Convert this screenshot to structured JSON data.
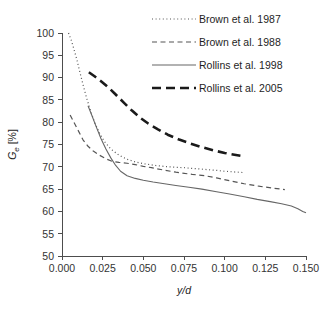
{
  "chart_data": {
    "type": "line",
    "title": "",
    "xlabel": "y/d",
    "ylabel": "Ge [%]",
    "ylabel_main": "G",
    "ylabel_sub": "e",
    "ylabel_unit": " [%]",
    "xlim": [
      0.0,
      0.15
    ],
    "ylim": [
      50,
      100
    ],
    "grid": false,
    "legend_position": "top-right",
    "xticks": [
      "0.000",
      "0.025",
      "0.050",
      "0.075",
      "0.100",
      "0.125",
      "0.150"
    ],
    "xtick_values": [
      0.0,
      0.025,
      0.05,
      0.075,
      0.1,
      0.125,
      0.15
    ],
    "yticks": [
      "50",
      "55",
      "60",
      "65",
      "70",
      "75",
      "80",
      "85",
      "90",
      "95",
      "100"
    ],
    "ytick_values": [
      50,
      55,
      60,
      65,
      70,
      75,
      80,
      85,
      90,
      95,
      100
    ],
    "series": [
      {
        "name": "Brown et al. 1987",
        "style": "dotted",
        "color": "#555555",
        "width": 1.2,
        "dash": "1,2.6",
        "points": [
          [
            0.004,
            100.0
          ],
          [
            0.0055,
            98.6
          ],
          [
            0.007,
            96.8
          ],
          [
            0.009,
            94.2
          ],
          [
            0.011,
            91.2
          ],
          [
            0.013,
            88.3
          ],
          [
            0.015,
            85.6
          ],
          [
            0.0175,
            82.6
          ],
          [
            0.02,
            80.0
          ],
          [
            0.023,
            77.6
          ],
          [
            0.026,
            75.7
          ],
          [
            0.03,
            74.0
          ],
          [
            0.035,
            72.6
          ],
          [
            0.04,
            71.7
          ],
          [
            0.045,
            71.1
          ],
          [
            0.05,
            70.7
          ],
          [
            0.0575,
            70.3
          ],
          [
            0.065,
            70.0
          ],
          [
            0.075,
            69.8
          ],
          [
            0.085,
            69.5
          ],
          [
            0.095,
            69.2
          ],
          [
            0.1,
            69.0
          ],
          [
            0.1075,
            68.8
          ],
          [
            0.112,
            68.7
          ]
        ]
      },
      {
        "name": "Brown et al. 1988",
        "style": "dashed",
        "color": "#555555",
        "width": 1.2,
        "dash": "5,3.5",
        "points": [
          [
            0.005,
            81.6
          ],
          [
            0.007,
            80.2
          ],
          [
            0.009,
            78.8
          ],
          [
            0.011,
            77.4
          ],
          [
            0.013,
            76.0
          ],
          [
            0.016,
            74.6
          ],
          [
            0.019,
            73.6
          ],
          [
            0.023,
            72.6
          ],
          [
            0.027,
            71.8
          ],
          [
            0.031,
            71.2
          ],
          [
            0.035,
            71.0
          ],
          [
            0.04,
            70.8
          ],
          [
            0.045,
            70.5
          ],
          [
            0.05,
            70.1
          ],
          [
            0.055,
            69.8
          ],
          [
            0.062,
            69.3
          ],
          [
            0.07,
            68.8
          ],
          [
            0.08,
            68.3
          ],
          [
            0.088,
            68.0
          ],
          [
            0.095,
            67.5
          ],
          [
            0.103,
            66.9
          ],
          [
            0.112,
            66.2
          ],
          [
            0.122,
            65.6
          ],
          [
            0.13,
            65.2
          ],
          [
            0.137,
            64.9
          ]
        ]
      },
      {
        "name": "Rollins et al. 1998",
        "style": "solid",
        "color": "#666666",
        "width": 1.1,
        "dash": "",
        "points": [
          [
            0.016,
            83.7
          ],
          [
            0.0185,
            81.4
          ],
          [
            0.021,
            79.0
          ],
          [
            0.024,
            76.3
          ],
          [
            0.027,
            74.0
          ],
          [
            0.03,
            72.0
          ],
          [
            0.033,
            70.3
          ],
          [
            0.036,
            69.0
          ],
          [
            0.04,
            68.0
          ],
          [
            0.045,
            67.4
          ],
          [
            0.05,
            67.0
          ],
          [
            0.056,
            66.6
          ],
          [
            0.063,
            66.2
          ],
          [
            0.07,
            65.8
          ],
          [
            0.078,
            65.4
          ],
          [
            0.086,
            65.0
          ],
          [
            0.095,
            64.4
          ],
          [
            0.103,
            63.9
          ],
          [
            0.112,
            63.3
          ],
          [
            0.12,
            62.7
          ],
          [
            0.128,
            62.2
          ],
          [
            0.135,
            61.7
          ],
          [
            0.141,
            61.2
          ],
          [
            0.145,
            60.6
          ],
          [
            0.148,
            60.0
          ],
          [
            0.15,
            59.7
          ]
        ]
      },
      {
        "name": "Rollins et al. 2005",
        "style": "thick-dashed",
        "color": "#1a1a1a",
        "width": 2.6,
        "dash": "9,5",
        "points": [
          [
            0.0165,
            91.2
          ],
          [
            0.02,
            90.3
          ],
          [
            0.024,
            89.2
          ],
          [
            0.0285,
            87.8
          ],
          [
            0.033,
            86.2
          ],
          [
            0.038,
            84.4
          ],
          [
            0.043,
            82.6
          ],
          [
            0.048,
            81.0
          ],
          [
            0.053,
            79.7
          ],
          [
            0.059,
            78.4
          ],
          [
            0.065,
            77.2
          ],
          [
            0.072,
            76.1
          ],
          [
            0.079,
            75.2
          ],
          [
            0.086,
            74.4
          ],
          [
            0.093,
            73.7
          ],
          [
            0.1,
            73.1
          ],
          [
            0.106,
            72.7
          ],
          [
            0.111,
            72.4
          ]
        ]
      }
    ]
  },
  "legend": {
    "items": [
      {
        "label": "Brown et al. 1987"
      },
      {
        "label": "Brown et al. 1988"
      },
      {
        "label": "Rollins et al. 1998"
      },
      {
        "label": "Rollins et al. 2005"
      }
    ]
  }
}
